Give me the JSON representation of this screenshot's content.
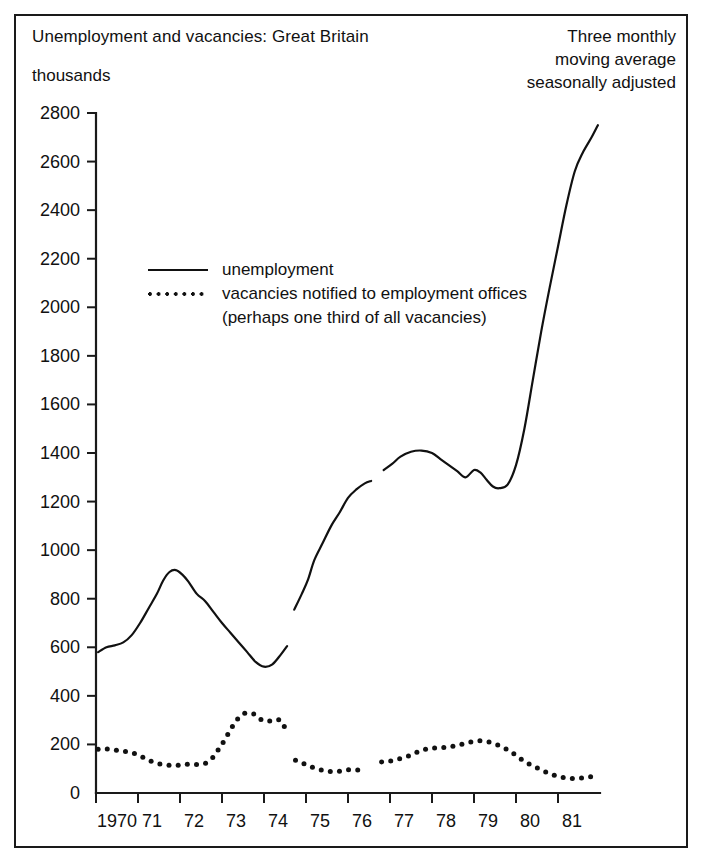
{
  "figure": {
    "title": "Unemployment and vacancies: Great Britain",
    "unit_label": "thousands",
    "note_lines": [
      "Three monthly",
      "moving average",
      "seasonally adjusted"
    ]
  },
  "legend": {
    "unemployment_label": "unemployment",
    "vacancies_label": "vacancies notified to employment offices",
    "vacancies_sublabel": "(perhaps one third of all vacancies)"
  },
  "chart_data": {
    "type": "line",
    "title": "Unemployment and vacancies: Great Britain",
    "subtitle": "Three monthly moving average seasonally adjusted",
    "xlabel": "",
    "ylabel": "thousands",
    "xlim": [
      1970.0,
      1982.0
    ],
    "ylim": [
      0,
      2800
    ],
    "grid": false,
    "legend_position": "inside-upper-left",
    "y_ticks": [
      0,
      200,
      400,
      600,
      800,
      1000,
      1200,
      1400,
      1600,
      1800,
      2000,
      2200,
      2400,
      2600,
      2800
    ],
    "x_ticks": [
      1970,
      1971,
      1972,
      1973,
      1974,
      1975,
      1976,
      1977,
      1978,
      1979,
      1980,
      1981
    ],
    "x_tick_labels": [
      "1970",
      "71",
      "72",
      "73",
      "74",
      "75",
      "76",
      "77",
      "78",
      "79",
      "80",
      "81"
    ],
    "series": [
      {
        "name": "unemployment",
        "style": "solid",
        "segments": [
          {
            "x": [
              1970.05,
              1970.25,
              1970.45,
              1970.65,
              1970.85,
              1971.05,
              1971.25,
              1971.45,
              1971.6,
              1971.75,
              1971.9,
              1972.05,
              1972.2,
              1972.4,
              1972.6,
              1972.8,
              1973.0,
              1973.2,
              1973.4,
              1973.6,
              1973.8,
              1974.0,
              1974.2,
              1974.4,
              1974.55
            ],
            "y": [
              580,
              600,
              608,
              620,
              650,
              700,
              760,
              820,
              875,
              910,
              918,
              900,
              870,
              820,
              790,
              745,
              700,
              660,
              620,
              580,
              540,
              520,
              530,
              570,
              605
            ]
          },
          {
            "x": [
              1974.72,
              1974.9,
              1975.05,
              1975.2,
              1975.4,
              1975.6,
              1975.8,
              1976.0,
              1976.2,
              1976.4,
              1976.55
            ],
            "y": [
              755,
              820,
              880,
              960,
              1030,
              1100,
              1155,
              1215,
              1250,
              1275,
              1285
            ]
          },
          {
            "x": [
              1976.85,
              1977.05,
              1977.25,
              1977.5,
              1977.75,
              1978.0,
              1978.2,
              1978.4,
              1978.6,
              1978.8,
              1979.0,
              1979.15,
              1979.3,
              1979.45,
              1979.6,
              1979.8,
              1980.0,
              1980.2,
              1980.4,
              1980.6,
              1980.8,
              1981.0,
              1981.2,
              1981.4,
              1981.6,
              1981.8,
              1981.95
            ],
            "y": [
              1330,
              1355,
              1385,
              1405,
              1410,
              1400,
              1375,
              1350,
              1325,
              1300,
              1330,
              1320,
              1290,
              1262,
              1255,
              1270,
              1350,
              1500,
              1700,
              1900,
              2080,
              2250,
              2420,
              2560,
              2640,
              2700,
              2750
            ]
          }
        ]
      },
      {
        "name": "vacancies notified to employment offices",
        "style": "dotted",
        "segments": [
          {
            "x": [
              1970.05,
              1970.2,
              1970.35,
              1970.5,
              1970.65,
              1970.8,
              1970.95,
              1971.1,
              1971.25,
              1971.4,
              1971.55,
              1971.7,
              1971.85,
              1972.0,
              1972.15,
              1972.3,
              1972.45,
              1972.6,
              1972.75,
              1972.9,
              1973.05,
              1973.2,
              1973.35,
              1973.5,
              1973.65,
              1973.8,
              1973.95,
              1974.1,
              1974.25,
              1974.4,
              1974.5
            ],
            "y": [
              180,
              182,
              180,
              176,
              172,
              168,
              160,
              148,
              135,
              125,
              118,
              115,
              113,
              115,
              118,
              117,
              118,
              122,
              140,
              175,
              215,
              260,
              300,
              325,
              330,
              322,
              300,
              295,
              302,
              298,
              268
            ]
          },
          {
            "x": [
              1974.75,
              1974.9,
              1975.05,
              1975.2,
              1975.35,
              1975.5,
              1975.65,
              1975.8,
              1975.95,
              1976.1,
              1976.25,
              1976.4
            ],
            "y": [
              135,
              125,
              112,
              103,
              95,
              90,
              88,
              90,
              95,
              96,
              95,
              100
            ]
          },
          {
            "x": [
              1976.8,
              1976.95,
              1977.1,
              1977.25,
              1977.4,
              1977.55,
              1977.7,
              1977.85,
              1978.0,
              1978.2,
              1978.4,
              1978.6,
              1978.8,
              1979.0,
              1979.15,
              1979.3,
              1979.45,
              1979.6,
              1979.8,
              1980.0,
              1980.2,
              1980.4,
              1980.6,
              1980.8,
              1981.0,
              1981.2,
              1981.4,
              1981.6,
              1981.8,
              1981.95
            ],
            "y": [
              128,
              130,
              135,
              142,
              150,
              160,
              172,
              180,
              185,
              186,
              190,
              196,
              205,
              212,
              215,
              212,
              205,
              195,
              178,
              155,
              130,
              112,
              95,
              80,
              68,
              62,
              60,
              62,
              68,
              75
            ]
          }
        ]
      }
    ]
  }
}
